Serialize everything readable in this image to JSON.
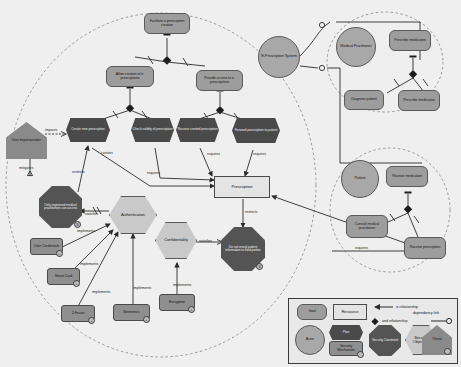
{
  "diagram": {
    "colors": {
      "goal": "#9d9d9d",
      "plan": "#4a4a4a",
      "actor": "#a8a8a8",
      "resource": "#e4e4e4",
      "security_objective": "#c9c9c9",
      "security_constraint": "#545454",
      "security_mechanism": "#8f8f8f",
      "threat": "#8a8a8a",
      "background": "#efefef",
      "line": "#2b2b2b"
    }
  },
  "actors": [
    {
      "id": "eps",
      "label": "E-Prescription System"
    },
    {
      "id": "medpract",
      "label": "Medical Practitioner"
    },
    {
      "id": "patient",
      "label": "Patient"
    }
  ],
  "goals": [
    {
      "id": "facilitate",
      "label": "Facilitate e-prescription creation"
    },
    {
      "id": "allow_create",
      "label": "Allow creation of e-prescriptions"
    },
    {
      "id": "provide_access",
      "label": "Provide access to e-prescriptions"
    },
    {
      "id": "prescribe_med_top",
      "label": "Prescribe medication"
    },
    {
      "id": "diagnose",
      "label": "Diagnose patient"
    },
    {
      "id": "prescribe_med",
      "label": "Prescribe medication"
    },
    {
      "id": "receive_med",
      "label": "Receive medication"
    },
    {
      "id": "consult",
      "label": "Consult medical practitioner"
    },
    {
      "id": "receive_presc",
      "label": "Receive prescription"
    }
  ],
  "plans": [
    {
      "id": "create_new",
      "label": "Create new prescription"
    },
    {
      "id": "check_valid",
      "label": "Check validity of prescription"
    },
    {
      "id": "receive_created",
      "label": "Receive created prescription"
    },
    {
      "id": "forward_presc",
      "label": "Forward prescription to patient"
    }
  ],
  "resources": [
    {
      "id": "prescription",
      "label": "Prescription"
    }
  ],
  "security_objectives": [
    {
      "id": "authentication",
      "label": "Authentication"
    },
    {
      "id": "confidentiality",
      "label": "Confidentiality"
    }
  ],
  "security_constraints": [
    {
      "id": "only_registered",
      "label": "Only registered medical practitioners can access",
      "badge": "S"
    },
    {
      "id": "no_reveal",
      "label": "Do not reveal patient information to third parties",
      "badge": "S"
    }
  ],
  "security_mechanisms": [
    {
      "id": "user_cred",
      "label": "User Credentials",
      "badge": "+"
    },
    {
      "id": "smart_card",
      "label": "Smart Card",
      "badge": "+"
    },
    {
      "id": "two_factor",
      "label": "2-Factor",
      "badge": "+"
    },
    {
      "id": "biometrics",
      "label": "Biometrics",
      "badge": "+"
    },
    {
      "id": "encryption",
      "label": "Encryption",
      "badge": "+"
    }
  ],
  "threats": [
    {
      "id": "user_imp",
      "label": "User impersonation"
    }
  ],
  "edge_labels": [
    {
      "id": "e_impacts",
      "label": "impacts"
    },
    {
      "id": "e_mitigates",
      "label": "mitigates"
    },
    {
      "id": "e_restricts1",
      "label": "restricts"
    },
    {
      "id": "e_creates",
      "label": "creates"
    },
    {
      "id": "e_requires1",
      "label": "requires"
    },
    {
      "id": "e_requires2",
      "label": "requires"
    },
    {
      "id": "e_requires3",
      "label": "requires"
    },
    {
      "id": "e_satisfies1",
      "label": "satisfies"
    },
    {
      "id": "e_satisfies2",
      "label": "satisfies"
    },
    {
      "id": "e_implements1",
      "label": "implements"
    },
    {
      "id": "e_implements2",
      "label": "implements"
    },
    {
      "id": "e_implements3",
      "label": "implements"
    },
    {
      "id": "e_implements4",
      "label": "implements"
    },
    {
      "id": "e_implements5",
      "label": "implements"
    },
    {
      "id": "e_restricts2",
      "label": "restricts"
    },
    {
      "id": "e_requires4",
      "label": "requires"
    }
  ],
  "legend": {
    "items": [
      {
        "id": "leg_goal",
        "label": "Goal"
      },
      {
        "id": "leg_res",
        "label": "Resource"
      },
      {
        "id": "leg_actor",
        "label": "Actor"
      },
      {
        "id": "leg_plan",
        "label": "Plan"
      },
      {
        "id": "leg_mech",
        "label": "Security Mechanism"
      },
      {
        "id": "leg_con",
        "label": "Security Constraint"
      },
      {
        "id": "leg_obj",
        "label": "Security Objective"
      },
      {
        "id": "leg_threat",
        "label": "Threat"
      }
    ],
    "relations": [
      {
        "id": "leg_is",
        "label": "is relationship"
      },
      {
        "id": "leg_and",
        "label": "and relationship"
      },
      {
        "id": "leg_dep",
        "label": "dependency link"
      }
    ]
  }
}
